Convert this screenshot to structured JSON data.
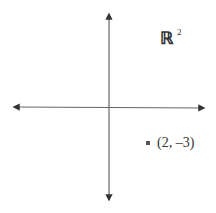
{
  "diagram": {
    "space_symbol": "ℝ",
    "space_exponent": "2",
    "point": {
      "x": 2,
      "y": -3,
      "label": "(2, –3)"
    },
    "colors": {
      "axis": "#555555",
      "point": "#555555",
      "text": "#333333"
    }
  }
}
